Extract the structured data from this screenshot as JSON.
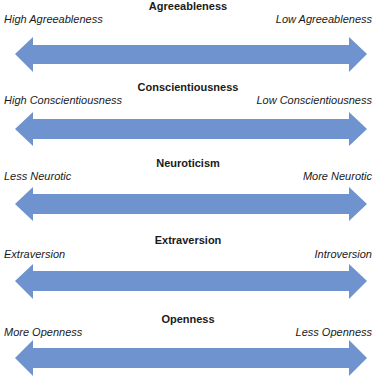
{
  "arrow_color": "#6F93CE",
  "dimensions": [
    {
      "title": "Agreeableness",
      "left_label": "High Agreeableness",
      "right_label": "Low Agreeableness"
    },
    {
      "title": "Conscientiousness",
      "left_label": "High Conscientiousness",
      "right_label": "Low Conscientiousness"
    },
    {
      "title": "Neuroticism",
      "left_label": "Less Neurotic",
      "right_label": "More Neurotic"
    },
    {
      "title": "Extraversion",
      "left_label": "Extraversion",
      "right_label": "Introversion"
    },
    {
      "title": "Openness",
      "left_label": "More Openness",
      "right_label": "Less Openness"
    }
  ]
}
